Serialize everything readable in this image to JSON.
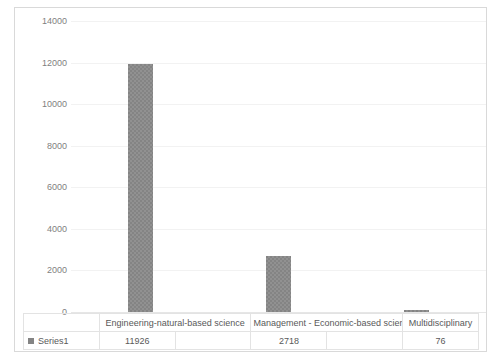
{
  "chart_data": {
    "type": "bar",
    "title": "",
    "xlabel": "",
    "ylabel": "",
    "categories": [
      "Engineering-natural-based science",
      "Management - Economic-based science",
      "Multidisciplinary"
    ],
    "series": [
      {
        "name": "Series1",
        "values": [
          11926,
          2718,
          76
        ]
      }
    ],
    "ylim": [
      0,
      14000
    ],
    "ytick_labels": [
      "0",
      "2000",
      "4000",
      "6000",
      "8000",
      "10000",
      "12000",
      "14000"
    ],
    "ytick_values": [
      0,
      2000,
      4000,
      6000,
      8000,
      10000,
      12000,
      14000
    ],
    "grid": true,
    "legend_position": "data-table",
    "bar_color": "#848484",
    "gridline_color": "#f2f2f2",
    "axis_text_color": "#7f7f7f",
    "data_table_shown": true
  },
  "legend": {
    "series_label": "Series1"
  },
  "table": {
    "category_labels": [
      "Engineering-natural-based science",
      "Management - Economic-based science",
      "Multidisciplinary"
    ],
    "value_labels": [
      "11926",
      "2718",
      "76"
    ]
  }
}
